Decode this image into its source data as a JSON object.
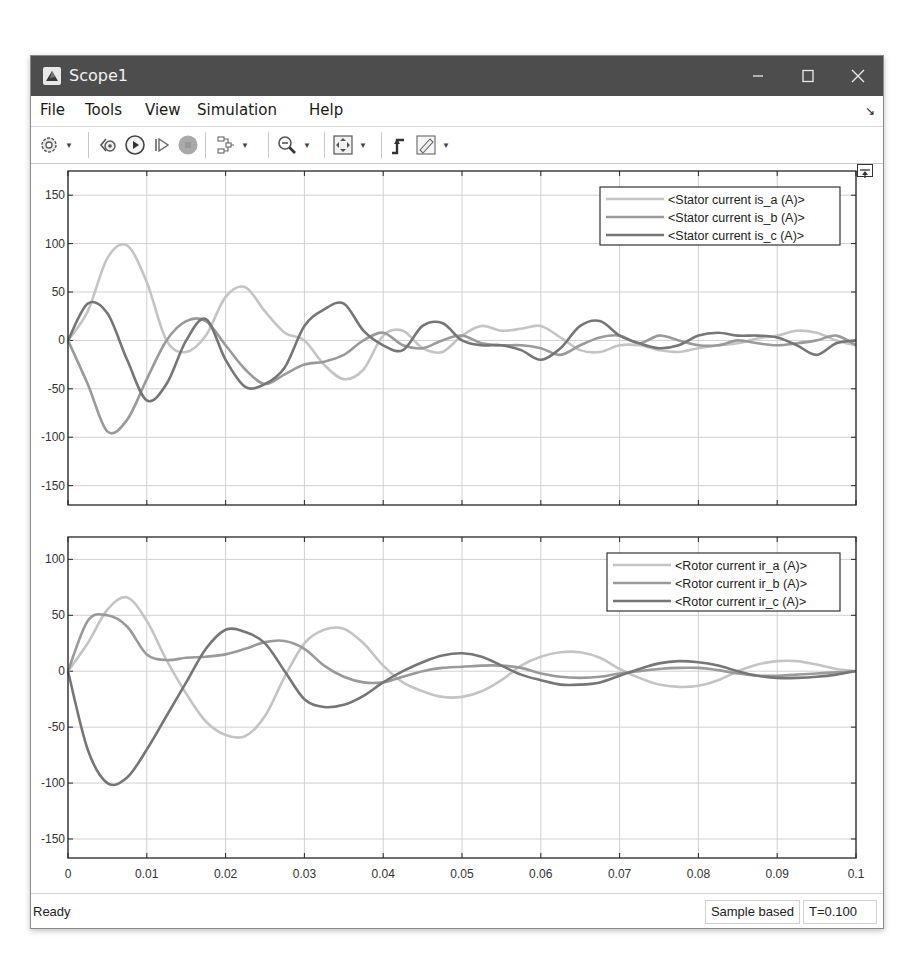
{
  "window": {
    "title": "Scope1",
    "controls": {
      "minimize": "–",
      "maximize": "☐",
      "close": "✕"
    }
  },
  "menubar": {
    "items": [
      {
        "label": "File"
      },
      {
        "label": "Tools"
      },
      {
        "label": "View"
      },
      {
        "label": "Simulation"
      },
      {
        "label": "Help"
      }
    ],
    "corner_icon": "dock-arrow-icon"
  },
  "toolbar": {
    "buttons": [
      {
        "name": "settings-button",
        "icon": "gear-icon",
        "has_dropdown": true
      },
      {
        "name": "step-back-button",
        "icon": "step-back-icon",
        "has_dropdown": false
      },
      {
        "name": "run-button",
        "icon": "play-icon",
        "has_dropdown": false
      },
      {
        "name": "step-forward-button",
        "icon": "step-forward-icon",
        "has_dropdown": false
      },
      {
        "name": "stop-button",
        "icon": "stop-icon",
        "has_dropdown": false
      },
      {
        "name": "highlight-button",
        "icon": "signal-hierarchy-icon",
        "has_dropdown": true
      },
      {
        "name": "zoom-button",
        "icon": "zoom-out-icon",
        "has_dropdown": true
      },
      {
        "name": "scale-axes-button",
        "icon": "fit-axes-icon",
        "has_dropdown": true
      },
      {
        "name": "triggers-button",
        "icon": "trigger-icon",
        "has_dropdown": false
      },
      {
        "name": "measurements-button",
        "icon": "ruler-icon",
        "has_dropdown": true
      }
    ]
  },
  "status": {
    "left": "Ready",
    "mode": "Sample based",
    "time": "T=0.100"
  },
  "colors": {
    "titlebar": "#4d4d4d",
    "series_a": "#c4c4c4",
    "series_b": "#9a9a9a",
    "series_c": "#767676",
    "grid": "#d0d0d0",
    "axis": "#262626"
  },
  "chart_data": [
    {
      "type": "line",
      "title": "",
      "xlabel": "",
      "ylabel": "",
      "xlim": [
        0,
        0.1
      ],
      "ylim": [
        -170,
        175
      ],
      "grid": true,
      "legend_position": "upper-right",
      "xticks": [
        "0",
        "0.01",
        "0.02",
        "0.03",
        "0.04",
        "0.05",
        "0.06",
        "0.07",
        "0.08",
        "0.09",
        "0.1"
      ],
      "yticks": [
        "150",
        "100",
        "50",
        "0",
        "-50",
        "-100",
        "-150"
      ],
      "yticks_values": [
        150,
        100,
        50,
        0,
        -50,
        -100,
        -150
      ],
      "x": [
        0,
        0.0025,
        0.005,
        0.0075,
        0.01,
        0.0125,
        0.015,
        0.0175,
        0.02,
        0.0225,
        0.025,
        0.0275,
        0.03,
        0.0325,
        0.035,
        0.0375,
        0.04,
        0.0425,
        0.045,
        0.0475,
        0.05,
        0.0525,
        0.055,
        0.0575,
        0.06,
        0.0625,
        0.065,
        0.0675,
        0.07,
        0.0725,
        0.075,
        0.0775,
        0.08,
        0.0825,
        0.085,
        0.0875,
        0.09,
        0.0925,
        0.095,
        0.0975,
        0.1
      ],
      "series": [
        {
          "name": "<Stator current is_a (A)>",
          "values": [
            0,
            30,
            85,
            98,
            60,
            0,
            -12,
            5,
            45,
            55,
            30,
            8,
            0,
            -25,
            -40,
            -30,
            5,
            10,
            -8,
            -12,
            5,
            15,
            10,
            12,
            15,
            3,
            -10,
            -12,
            -5,
            -5,
            -10,
            -12,
            -8,
            -5,
            -3,
            2,
            5,
            10,
            8,
            0,
            -5
          ]
        },
        {
          "name": "<Stator current is_b (A)>",
          "values": [
            0,
            -45,
            -94,
            -82,
            -40,
            0,
            20,
            20,
            -5,
            -30,
            -45,
            -35,
            -25,
            -22,
            -15,
            0,
            8,
            -5,
            -8,
            0,
            5,
            -3,
            -5,
            -5,
            -8,
            -15,
            -5,
            3,
            5,
            -3,
            5,
            0,
            -5,
            -5,
            0,
            -3,
            -5,
            -3,
            0,
            5,
            -5
          ]
        },
        {
          "name": "<Stator current is_c (A)>",
          "values": [
            0,
            38,
            28,
            -20,
            -62,
            -45,
            0,
            22,
            -20,
            -48,
            -45,
            -28,
            15,
            32,
            38,
            10,
            -5,
            -10,
            15,
            18,
            0,
            -5,
            -5,
            -10,
            -20,
            -8,
            15,
            20,
            5,
            -3,
            -8,
            -5,
            5,
            8,
            5,
            5,
            3,
            -5,
            -15,
            -3,
            0
          ]
        }
      ]
    },
    {
      "type": "line",
      "title": "",
      "xlabel": "",
      "ylabel": "",
      "xlim": [
        0,
        0.1
      ],
      "ylim": [
        -167,
        120
      ],
      "grid": true,
      "legend_position": "upper-right",
      "xticks": [
        "0",
        "0.01",
        "0.02",
        "0.03",
        "0.04",
        "0.05",
        "0.06",
        "0.07",
        "0.08",
        "0.09",
        "0.1"
      ],
      "yticks": [
        "100",
        "50",
        "0",
        "-50",
        "-100",
        "-150"
      ],
      "yticks_values": [
        100,
        50,
        0,
        -50,
        -100,
        -150
      ],
      "x": [
        0,
        0.0025,
        0.005,
        0.0075,
        0.01,
        0.0125,
        0.015,
        0.0175,
        0.02,
        0.0225,
        0.025,
        0.0275,
        0.03,
        0.0325,
        0.035,
        0.0375,
        0.04,
        0.0425,
        0.045,
        0.0475,
        0.05,
        0.0525,
        0.055,
        0.0575,
        0.06,
        0.0625,
        0.065,
        0.0675,
        0.07,
        0.0725,
        0.075,
        0.0775,
        0.08,
        0.0825,
        0.085,
        0.0875,
        0.09,
        0.0925,
        0.095,
        0.0975,
        0.1
      ],
      "series": [
        {
          "name": "<Rotor current ir_a (A)>",
          "values": [
            0,
            25,
            55,
            66,
            45,
            10,
            -20,
            -45,
            -57,
            -58,
            -40,
            -5,
            25,
            37,
            38,
            25,
            5,
            -10,
            -18,
            -23,
            -23,
            -18,
            -8,
            5,
            13,
            17,
            17,
            12,
            2,
            -6,
            -12,
            -14,
            -13,
            -8,
            0,
            6,
            9,
            9,
            6,
            2,
            0
          ]
        },
        {
          "name": "<Rotor current ir_b (A)>",
          "values": [
            0,
            45,
            50,
            40,
            15,
            10,
            12,
            13,
            15,
            20,
            26,
            27,
            20,
            5,
            -5,
            -10,
            -10,
            -5,
            0,
            3,
            4,
            5,
            5,
            3,
            -2,
            -5,
            -6,
            -5,
            -2,
            0,
            2,
            3,
            3,
            1,
            -2,
            -4,
            -4,
            -3,
            -2,
            -1,
            0
          ]
        },
        {
          "name": "<Rotor current ir_c (A)>",
          "values": [
            0,
            -70,
            -100,
            -95,
            -70,
            -40,
            -10,
            20,
            37,
            35,
            25,
            0,
            -25,
            -32,
            -30,
            -22,
            -10,
            0,
            8,
            14,
            16,
            13,
            5,
            -3,
            -8,
            -12,
            -12,
            -10,
            -4,
            2,
            7,
            9,
            8,
            5,
            0,
            -4,
            -6,
            -6,
            -5,
            -3,
            0
          ]
        }
      ]
    }
  ]
}
